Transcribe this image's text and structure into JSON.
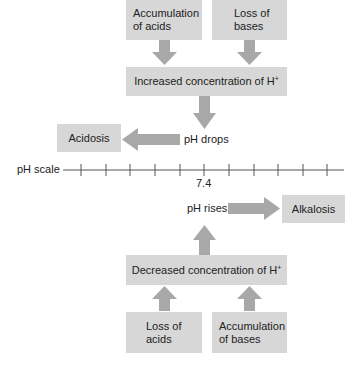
{
  "colors": {
    "box": "#d7d7d7",
    "arrow": "#a8a8a8",
    "line": "#555555",
    "text": "#222222"
  },
  "top": {
    "causes": [
      {
        "line1": "Accumulation",
        "line2": "of acids"
      },
      {
        "line1": "Loss of",
        "line2": "bases"
      }
    ],
    "effect": {
      "text": "Increased concentration of H",
      "sup": "+"
    },
    "result_label": "pH drops",
    "outcome": "Acidosis"
  },
  "scale": {
    "label": "pH scale",
    "tick_count": 11,
    "center_value": "7.4"
  },
  "bottom": {
    "result_label": "pH rises",
    "outcome": "Alkalosis",
    "effect": {
      "text": "Decreased concentration of H",
      "sup": "+"
    },
    "causes": [
      {
        "line1": "Loss of",
        "line2": "acids"
      },
      {
        "line1": "Accumulation",
        "line2": "of bases"
      }
    ]
  }
}
